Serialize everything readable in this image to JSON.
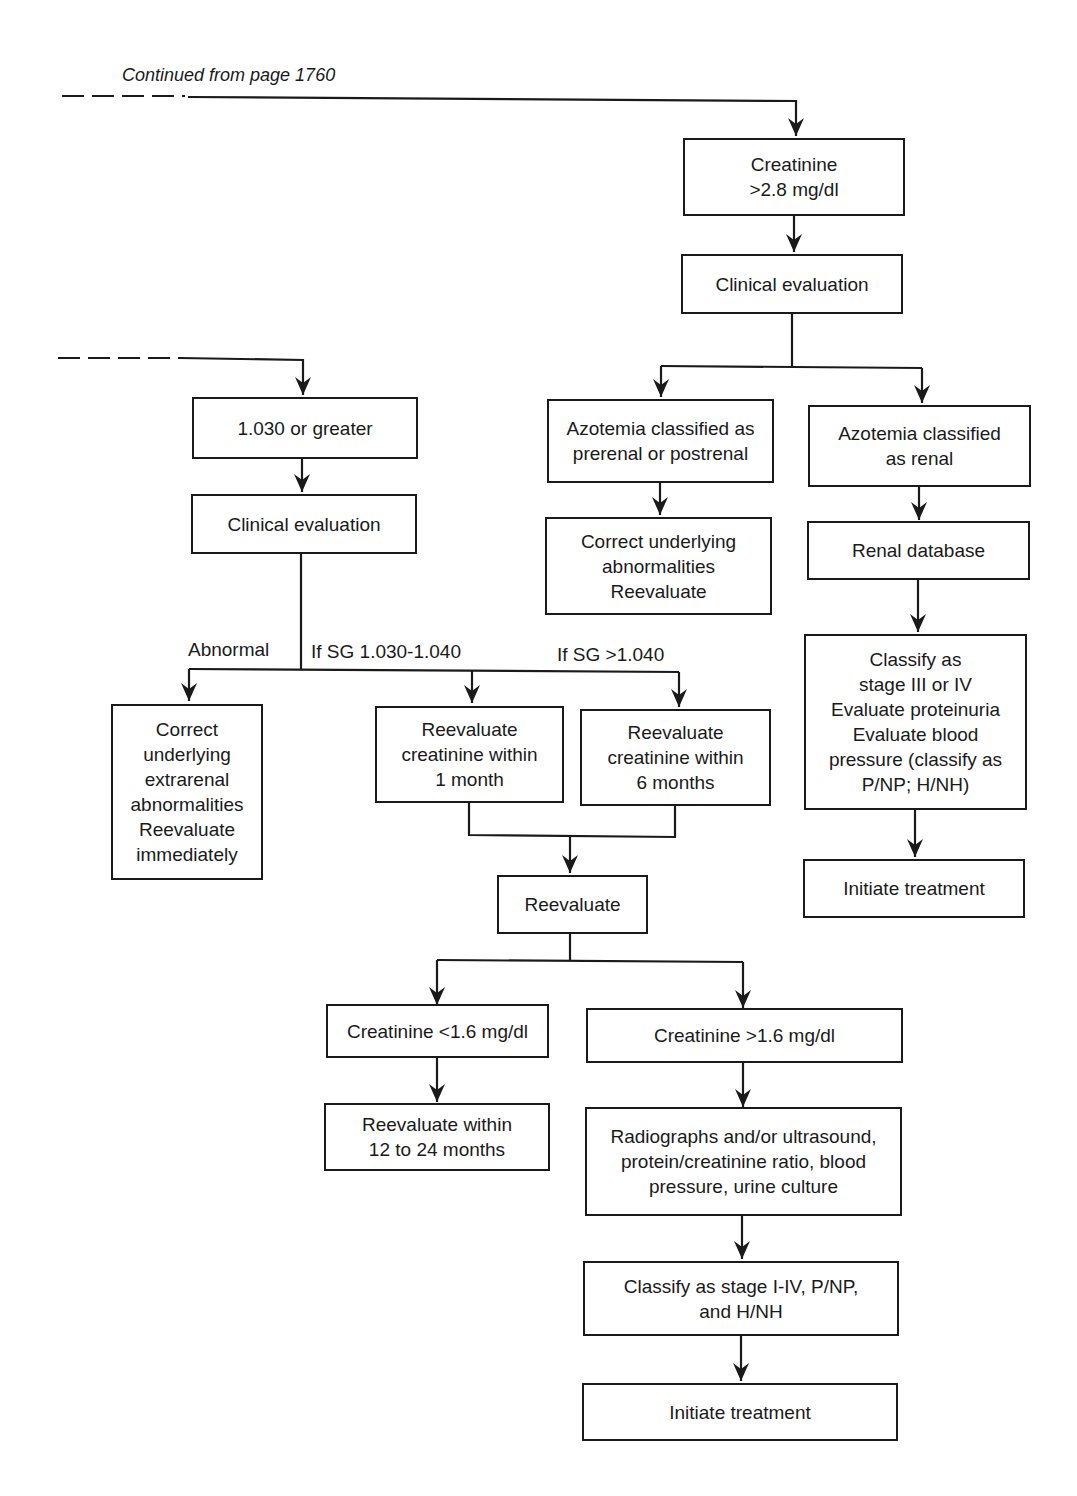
{
  "diagram": {
    "continuation_label": "Continued from page 1760",
    "right_branch": {
      "creatinine_high": "Creatinine\n>2.8 mg/dl",
      "clinical_evaluation": "Clinical evaluation",
      "azotemia_prerenal": "Azotemia classified as\nprerenal or postrenal",
      "correct_underlying": "Correct underlying\nabnormalities\nReevaluate",
      "azotemia_renal": "Azotemia classified\nas renal",
      "renal_database": "Renal database",
      "classify_stage": "Classify as\nstage III or IV\nEvaluate proteinuria\nEvaluate blood\npressure (classify as\nP/NP; H/NH)",
      "initiate_treatment": "Initiate treatment"
    },
    "left_branch": {
      "sg_greater": "1.030 or greater",
      "clinical_evaluation": "Clinical evaluation",
      "label_abnormal": "Abnormal",
      "label_sg_range": "If SG 1.030-1.040",
      "label_sg_high": "If SG >1.040",
      "correct_extrarenal": "Correct\nunderlying\nextrarenal\nabnormalities\nReevaluate\nimmediately",
      "reevaluate_1_month": "Reevaluate\ncreatinine within\n1 month",
      "reevaluate_6_months": "Reevaluate\ncreatinine within\n6 months",
      "reevaluate": "Reevaluate",
      "creatinine_low": "Creatinine <1.6 mg/dl",
      "creatinine_mid": "Creatinine >1.6 mg/dl",
      "reevaluate_12_24": "Reevaluate within\n12 to 24 months",
      "diagnostics": "Radiographs and/or ultrasound,\nprotein/creatinine ratio, blood\npressure, urine culture",
      "classify_stage_all": "Classify as stage I-IV, P/NP,\nand H/NH",
      "initiate_treatment": "Initiate treatment"
    }
  }
}
